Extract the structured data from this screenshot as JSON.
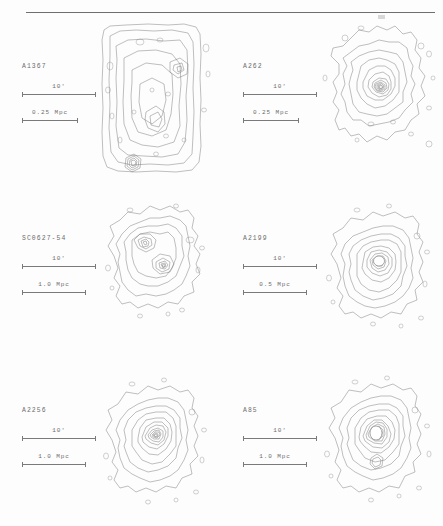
{
  "figure": {
    "layout": "3 rows x 2 columns",
    "panel_count": 6,
    "top_rule": true
  },
  "panels": [
    {
      "id": "a1367",
      "name": "A1367",
      "position": "row-1 col-left",
      "angular_scale": {
        "label": "10'",
        "value": 10,
        "unit": "arcmin"
      },
      "physical_scale": {
        "label": "0.25 Mpc",
        "value": 0.25,
        "unit": "Mpc"
      },
      "morphology": "irregular, multiple subclumps, boxed field edge",
      "peaks": 3
    },
    {
      "id": "a262",
      "name": "A262",
      "position": "row-1 col-right",
      "angular_scale": {
        "label": "10'",
        "value": 10,
        "unit": "arcmin"
      },
      "physical_scale": {
        "label": "0.25 Mpc",
        "value": 0.25,
        "unit": "Mpc"
      },
      "morphology": "centrally peaked, regular core, irregular outskirts",
      "peaks": 1
    },
    {
      "id": "sc0627-54",
      "name": "SC0627-54",
      "position": "row-2 col-left",
      "angular_scale": {
        "label": "10'",
        "value": 10,
        "unit": "arcmin"
      },
      "physical_scale": {
        "label": "1.0 Mpc",
        "value": 1.0,
        "unit": "Mpc"
      },
      "morphology": "double / bimodal structure",
      "peaks": 2
    },
    {
      "id": "a2199",
      "name": "A2199",
      "position": "row-2 col-right",
      "angular_scale": {
        "label": "10'",
        "value": 10,
        "unit": "arcmin"
      },
      "physical_scale": {
        "label": "0.5 Mpc",
        "value": 0.5,
        "unit": "Mpc"
      },
      "morphology": "strongly peaked cooling core, regular",
      "peaks": 1
    },
    {
      "id": "a2256",
      "name": "A2256",
      "position": "row-3 col-left",
      "angular_scale": {
        "label": "10'",
        "value": 10,
        "unit": "arcmin"
      },
      "physical_scale": {
        "label": "1.0 Mpc",
        "value": 1.0,
        "unit": "Mpc"
      },
      "morphology": "elongated, elliptical, mildly disturbed",
      "peaks": 1
    },
    {
      "id": "a85",
      "name": "A85",
      "position": "row-3 col-right",
      "angular_scale": {
        "label": "10'",
        "value": 10,
        "unit": "arcmin"
      },
      "physical_scale": {
        "label": "1.0 Mpc",
        "value": 1.0,
        "unit": "Mpc"
      },
      "morphology": "strongly peaked core with southern subclump",
      "peaks": 2
    }
  ],
  "colors": {
    "contour_stroke": "#707070",
    "text": "#6c6c6c",
    "rule": "#6f6f6f",
    "background": "#fdfdfd"
  }
}
